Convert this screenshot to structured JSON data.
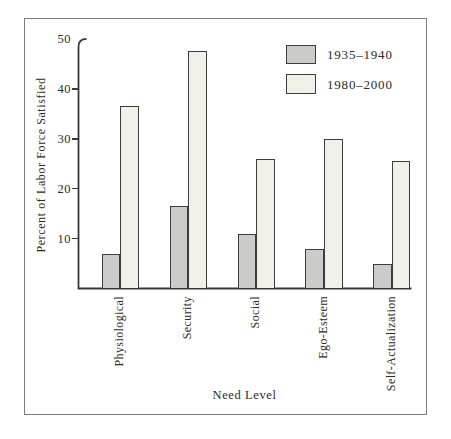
{
  "figure": {
    "background_color": "#ffffff",
    "frame_border_color": "#7d7d7d",
    "text_color": "#2b2b2b",
    "axis_color": "#383838"
  },
  "chart_data": {
    "type": "bar",
    "title": "",
    "xlabel": "Need Level",
    "ylabel": "Percent of Labor Force Satisfied",
    "categories": [
      "Physiological",
      "Security",
      "Social",
      "Ego-Esteem",
      "Self-Actualization"
    ],
    "series": [
      {
        "name": "1935–1940",
        "color": "#cbcbc9",
        "values": [
          7,
          16.5,
          11,
          8,
          5
        ]
      },
      {
        "name": "1980–2000",
        "color": "#f1f0e9",
        "values": [
          36.5,
          47.5,
          26,
          30,
          25.5
        ]
      }
    ],
    "ylim": [
      0,
      50
    ],
    "yticks": [
      10,
      20,
      30,
      40,
      50
    ],
    "grid": false,
    "legend_position": "upper-right",
    "bar_outline_color": "#3d3d3d"
  }
}
